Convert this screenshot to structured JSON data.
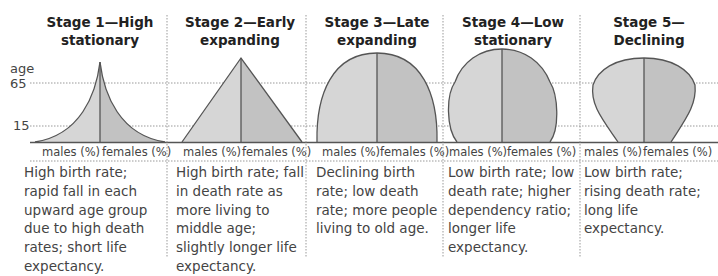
{
  "axis": {
    "age_label": "age",
    "tick_65": "65",
    "tick_15": "15"
  },
  "stages": [
    {
      "title_line1": "Stage 1—High",
      "title_line2": "stationary",
      "males_label": "males (%)",
      "females_label": "females (%)",
      "description": "High birth rate; rapid fall in each upward age group due to high death rates; short life expectancy."
    },
    {
      "title_line1": "Stage 2—Early",
      "title_line2": "expanding",
      "males_label": "males (%)",
      "females_label": "females (%)",
      "description": "High birth rate; fall in death rate as more living to middle age; slightly longer life expectancy."
    },
    {
      "title_line1": "Stage 3—Late",
      "title_line2": "expanding",
      "males_label": "males (%)",
      "females_label": "females (%)",
      "description": "Declining birth rate; low death rate; more people living to old age."
    },
    {
      "title_line1": "Stage 4—Low",
      "title_line2": "stationary",
      "males_label": "males (%)",
      "females_label": "females (%)",
      "description": "Low birth rate; low death rate; higher dependency ratio; longer life expectancy."
    },
    {
      "title_line1": "Stage 5—Declining",
      "title_line2": "",
      "males_label": "males (%)",
      "females_label": "females (%)",
      "description": "Low birth rate; rising death rate; long life expectancy."
    }
  ],
  "colors": {
    "males_fill": "#d6d6d6",
    "females_fill": "#c2c2c2",
    "outline": "#555555",
    "grid": "#999999"
  }
}
